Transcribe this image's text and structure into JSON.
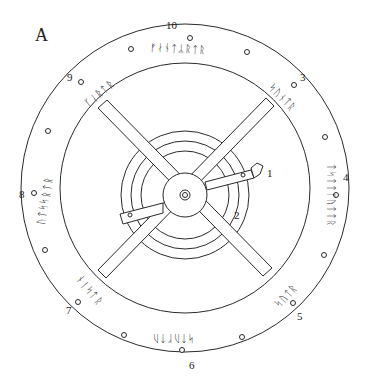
{
  "figure": {
    "panel_label": "A",
    "colors": {
      "stroke": "#2a2a2a",
      "background": "#ffffff"
    },
    "numbers": [
      {
        "id": "n10",
        "text": "10",
        "x": 166,
        "y": 20
      },
      {
        "id": "n9",
        "text": "9",
        "x": 67,
        "y": 72
      },
      {
        "id": "n3",
        "text": "3",
        "x": 300,
        "y": 72
      },
      {
        "id": "n1",
        "text": "1",
        "x": 267,
        "y": 168
      },
      {
        "id": "n4",
        "text": "4",
        "x": 343,
        "y": 172
      },
      {
        "id": "n8",
        "text": "8",
        "x": 19,
        "y": 189
      },
      {
        "id": "n2",
        "text": "2",
        "x": 234,
        "y": 210
      },
      {
        "id": "n5",
        "text": "5",
        "x": 297,
        "y": 311
      },
      {
        "id": "n7",
        "text": "7",
        "x": 66,
        "y": 305
      },
      {
        "id": "n6",
        "text": "6",
        "x": 189,
        "y": 360
      }
    ],
    "rune_groups": [
      {
        "id": "top",
        "text": "ᚠᛅᚾᛏᛦᚱᛏᚱ",
        "x": 150,
        "y": 43,
        "rot": 3
      },
      {
        "id": "upper-left",
        "text": "ᚴᛆᚱᛏᚱ",
        "x": 82,
        "y": 88,
        "rot": -40
      },
      {
        "id": "upper-right",
        "text": "ᛋᚢᚾᛏᚱ",
        "x": 265,
        "y": 92,
        "rot": 45
      },
      {
        "id": "right",
        "text": "ᛏᛋᛏᛏᚴᚢᛏᛏᚱ",
        "x": 300,
        "y": 190,
        "rot": 90
      },
      {
        "id": "left",
        "text": "ᚢᛏᛋᛋᚱᛏᚱ",
        "x": 20,
        "y": 195,
        "rot": -80
      },
      {
        "id": "lower-left",
        "text": "ᚾᛁᛋᛏᚱ",
        "x": 72,
        "y": 285,
        "rot": 50
      },
      {
        "id": "lower-right",
        "text": "ᛋᚢᛏᚱ",
        "x": 272,
        "y": 290,
        "rot": -48
      },
      {
        "id": "bottom",
        "text": "ᛋᛏᚢᚴᛏᚢ",
        "x": 152,
        "y": 333,
        "rot": 180
      }
    ]
  }
}
